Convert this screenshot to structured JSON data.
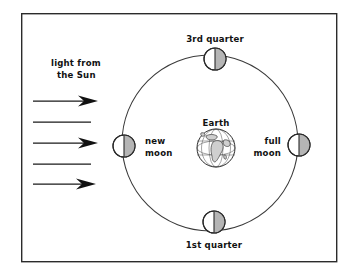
{
  "diagram": {
    "frame": {
      "x": 21,
      "y": 13,
      "width": 316,
      "height": 249,
      "stroke_color": "#2b2b2b"
    },
    "orbit": {
      "center_x": 210,
      "center_y": 143,
      "radius": 88,
      "stroke_color": "#3a3a3a"
    },
    "sun_label": {
      "line1": "light from",
      "line2": "the Sun",
      "x": 76,
      "y": 68
    },
    "rays": [
      {
        "name": "ray-1",
        "y": 101,
        "x_start": 33,
        "x_end": 96,
        "has_arrowhead": true
      },
      {
        "name": "ray-2",
        "y": 122,
        "x_start": 33,
        "x_end": 91,
        "has_arrowhead": false
      },
      {
        "name": "ray-3",
        "y": 143,
        "x_start": 33,
        "x_end": 96,
        "has_arrowhead": true
      },
      {
        "name": "ray-4",
        "y": 164,
        "x_start": 33,
        "x_end": 91,
        "has_arrowhead": false
      },
      {
        "name": "ray-5",
        "y": 184,
        "x_start": 33,
        "x_end": 96,
        "has_arrowhead": true
      }
    ],
    "ray_color": "#1a1a1a",
    "earth": {
      "label": "Earth",
      "label_x": 216,
      "label_y": 124,
      "center_x": 216,
      "center_y": 148,
      "radius": 19,
      "ocean_color": "#ffffff",
      "land_color": "#cfcfcf"
    },
    "moons": [
      {
        "id": "third-quarter",
        "label": "3rd quarter",
        "label_line1": "3rd quarter",
        "label_line2": "",
        "center_x": 215,
        "center_y": 59,
        "radius": 11,
        "label_x": 215,
        "label_y": 40,
        "label_anchor": "middle",
        "shaded_side": "right",
        "shade_color": "#b5b5b5"
      },
      {
        "id": "new-moon",
        "label": "new moon",
        "label_line1": "new",
        "label_line2": "moon",
        "center_x": 124,
        "center_y": 146,
        "radius": 11,
        "label_x": 145,
        "label_y": 143,
        "label_anchor": "start",
        "shaded_side": "right",
        "shade_color": "#b5b5b5"
      },
      {
        "id": "full-moon",
        "label": "full moon",
        "label_line1": "full",
        "label_line2": "moon",
        "center_x": 299,
        "center_y": 145,
        "radius": 11,
        "label_x": 283,
        "label_y": 143,
        "label_anchor": "end",
        "shaded_side": "right",
        "shade_color": "#b5b5b5"
      },
      {
        "id": "first-quarter",
        "label": "1st quarter",
        "label_line1": "1st quarter",
        "label_line2": "",
        "center_x": 214,
        "center_y": 222,
        "radius": 11,
        "label_x": 214,
        "label_y": 248,
        "label_anchor": "middle",
        "shaded_side": "right",
        "shade_color": "#b5b5b5"
      }
    ],
    "colors": {
      "background": "#ffffff",
      "ink": "#111111",
      "orbit": "#3a3a3a",
      "frame": "#2b2b2b",
      "moon_shade": "#b5b5b5",
      "earth_land": "#cfcfcf"
    }
  }
}
